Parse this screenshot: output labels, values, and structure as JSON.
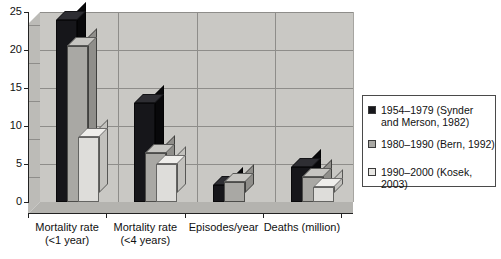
{
  "chart_data": {
    "type": "bar",
    "title": "",
    "subtitle": "",
    "xlabel": "",
    "ylabel": "",
    "ylim": [
      0,
      25
    ],
    "yticks": [
      0,
      5,
      10,
      15,
      20,
      25
    ],
    "grid": true,
    "legend_position": "right",
    "style": "3d-column",
    "categories": [
      "Mortality rate\n(<1 year)",
      "Mortality rate\n(<4 years)",
      "Episodes/year",
      "Deaths (million)"
    ],
    "series": [
      {
        "name": "1954–1979 (Synder\nand Merson, 1982)",
        "color": "#17171b",
        "values": [
          24,
          13,
          2.3,
          4.6
        ]
      },
      {
        "name": "1980–1990 (Bern, 1992)",
        "color": "#a9a8a4",
        "values": [
          20.5,
          6.5,
          2.6,
          3.3
        ]
      },
      {
        "name": "1990–2000 (Kosek, 2003)",
        "color": "#e8e7e4",
        "values": [
          8.5,
          5.0,
          0,
          2.0
        ]
      }
    ]
  },
  "axis": {
    "y_tick_labels": [
      "0",
      "5",
      "10",
      "15",
      "20",
      "25"
    ]
  },
  "legend": {
    "entries": [
      {
        "label": "1954–1979 (Synder\nand Merson, 1982)",
        "swatch": "black-swatch"
      },
      {
        "label": "1980–1990 (Bern, 1992)",
        "swatch": "gray-swatch"
      },
      {
        "label": "1990–2000 (Kosek, 2003)",
        "swatch": "light-gray-swatch"
      }
    ]
  },
  "colors": {
    "plot_background": "#c9c8c4",
    "series_1": "#17171b",
    "series_2": "#a9a8a4",
    "series_3": "#e8e7e4",
    "gridline": "#8e8d8a",
    "axis": "#222222"
  }
}
